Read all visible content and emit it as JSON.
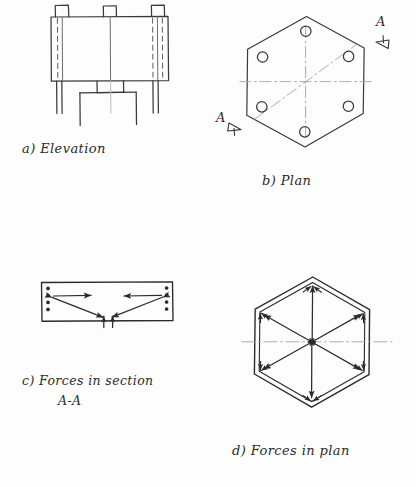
{
  "sheet": {
    "width": 416,
    "height": 487,
    "background_color": "#fdfdfd",
    "ink_color": "#2b2b2b",
    "light_ink_color": "#9a9a9a",
    "medium": "hand-drawn pencil engineering sketch",
    "subject": "Hexagonal base plate / bolted connection force study"
  },
  "figures": [
    {
      "id": "a",
      "caption": "a) Elevation",
      "caption_x": 22,
      "caption_y": 140,
      "type": "elevation-view",
      "description": "Rectangular body with three small tabs on top edge, dashed hidden lines inside near each end, two long legs dropping from the ends and a central stub leg assembly below",
      "tabs": 3,
      "hidden_line_pairs": 2,
      "legs": 2,
      "center_stub": true
    },
    {
      "id": "b",
      "caption": "b) Plan",
      "caption_x": 262,
      "caption_y": 172,
      "type": "plan-view",
      "description": "Regular hexagon in plan with six bolt holes set in from the vertices, three dash-dot centre lines crossing at the centre",
      "bolt_holes": 6,
      "centre_lines": 3,
      "section_marks": [
        {
          "label": "A",
          "position": "upper-right",
          "x": 378,
          "y": 22,
          "arrow_direction": "down-left"
        },
        {
          "label": "A",
          "position": "lower-left",
          "x": 218,
          "y": 118,
          "arrow_direction": "down-right"
        }
      ]
    },
    {
      "id": "c",
      "caption_line_1": "c) Forces in section",
      "caption_line_2": "A-A",
      "caption_x": 22,
      "caption_y": 372,
      "caption_indent": 36,
      "type": "section-force-diagram",
      "description": "Rectangular section A-A with four bolt dots at each end, inward horizontal force arrows at the top and diagonal force arrows converging to two upward reactions at the bottom centre",
      "bolt_dots_per_side": 4,
      "horizontal_arrows": 2,
      "diagonal_arrows": 2,
      "reaction_arrows": 2
    },
    {
      "id": "d",
      "caption": "d) Forces in plan",
      "caption_x": 232,
      "caption_y": 442,
      "type": "plan-force-diagram",
      "description": "Double-outlined hexagon with six double-headed force arrows running from the centre out to each vertex, arrowheads converging at the centre, plus a horizontal dash-dot centre line running through",
      "radial_arrows": 6,
      "centre_lines": 1,
      "double_outline": true
    }
  ]
}
